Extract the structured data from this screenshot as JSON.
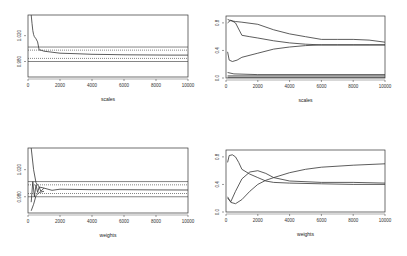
{
  "figure": {
    "layout": "2x2",
    "background": "#ffffff",
    "line_color": "#333333"
  },
  "chart_data": [
    {
      "id": "top-left",
      "type": "line",
      "title": "",
      "xlabel": "scales",
      "ylabel": "",
      "xlim": [
        0,
        10000
      ],
      "ylim": [
        0.97,
        1.03
      ],
      "xticks": [
        0,
        2000,
        4000,
        6000,
        8000,
        10000
      ],
      "xtick_labels": [
        "0",
        "2000",
        "4000",
        "6000",
        "8000",
        "10000"
      ],
      "yticks": [
        1.01,
        0.985
      ],
      "ytick_labels": [
        "1.020",
        "0.980"
      ],
      "grid": false,
      "hlines": [
        {
          "y": 0.999,
          "style": "solid"
        },
        {
          "y": 0.996,
          "style": "dotted"
        },
        {
          "y": 0.988,
          "style": "dotted"
        },
        {
          "y": 0.985,
          "style": "solid"
        }
      ],
      "series": [
        {
          "name": "estimate",
          "x": [
            200,
            250,
            300,
            350,
            400,
            500,
            600,
            700,
            800,
            1000,
            2000,
            3000,
            4000,
            5000,
            6000,
            7000,
            8000,
            9000,
            10000
          ],
          "y": [
            1.03,
            1.022,
            1.015,
            1.011,
            1.009,
            1.007,
            1.004,
            0.996,
            0.996,
            0.995,
            0.993,
            0.9925,
            0.992,
            0.9918,
            0.9915,
            0.9914,
            0.9913,
            0.9912,
            0.9912
          ]
        }
      ]
    },
    {
      "id": "top-right",
      "type": "line",
      "title": "",
      "xlabel": "scales",
      "ylabel": "",
      "xlim": [
        0,
        10000
      ],
      "ylim": [
        0.0,
        0.9
      ],
      "xticks": [
        0,
        2000,
        4000,
        6000,
        8000,
        10000
      ],
      "xtick_labels": [
        "0",
        "2000",
        "4000",
        "6000",
        "8000",
        "10000"
      ],
      "yticks": [
        0.8,
        0.4,
        0.0
      ],
      "ytick_labels": [
        "0.8",
        "0.4",
        "0.0"
      ],
      "grid": false,
      "series": [
        {
          "name": "s1",
          "x": [
            100,
            300,
            600,
            1000,
            2000,
            3000,
            4000,
            5000,
            6000,
            7000,
            8000,
            9000,
            10000
          ],
          "y": [
            0.85,
            0.83,
            0.82,
            0.81,
            0.78,
            0.7,
            0.64,
            0.6,
            0.56,
            0.56,
            0.56,
            0.55,
            0.52
          ]
        },
        {
          "name": "s2",
          "x": [
            100,
            300,
            600,
            1000,
            1500,
            2000,
            3000,
            4000,
            5000,
            6000,
            7000,
            8000,
            9000,
            10000
          ],
          "y": [
            0.8,
            0.84,
            0.8,
            0.62,
            0.6,
            0.58,
            0.54,
            0.51,
            0.49,
            0.48,
            0.48,
            0.48,
            0.48,
            0.48
          ]
        },
        {
          "name": "s3",
          "x": [
            100,
            200,
            400,
            700,
            1000,
            2000,
            3000,
            4000,
            5000,
            6000,
            7000,
            8000,
            9000,
            10000
          ],
          "y": [
            0.38,
            0.26,
            0.24,
            0.26,
            0.3,
            0.36,
            0.42,
            0.45,
            0.47,
            0.48,
            0.48,
            0.48,
            0.48,
            0.48
          ]
        },
        {
          "name": "s4",
          "x": [
            100,
            500,
            2000,
            10000
          ],
          "y": [
            0.08,
            0.06,
            0.05,
            0.05
          ]
        },
        {
          "name": "s5",
          "x": [
            100,
            10000
          ],
          "y": [
            0.03,
            0.03
          ]
        },
        {
          "name": "s6",
          "x": [
            100,
            10000
          ],
          "y": [
            0.01,
            0.01
          ]
        }
      ]
    },
    {
      "id": "bottom-left",
      "type": "line",
      "title": "",
      "xlabel": "weights",
      "ylabel": "",
      "xlim": [
        0,
        10000
      ],
      "ylim": [
        0.97,
        1.03
      ],
      "xticks": [
        0,
        2000,
        4000,
        6000,
        8000,
        10000
      ],
      "xtick_labels": [
        "0",
        "2000",
        "4000",
        "6000",
        "8000",
        "10000"
      ],
      "yticks": [
        1.01,
        0.985
      ],
      "ytick_labels": [
        "1.020",
        "0.980"
      ],
      "grid": false,
      "hlines": [
        {
          "y": 0.999,
          "style": "solid"
        },
        {
          "y": 0.996,
          "style": "dotted"
        },
        {
          "y": 0.988,
          "style": "dotted"
        },
        {
          "y": 0.985,
          "style": "solid"
        }
      ],
      "series": [
        {
          "name": "estimate",
          "x": [
            200,
            300,
            400,
            500,
            600,
            700,
            800,
            1000,
            1500,
            2000,
            4000,
            6000,
            8000,
            10000
          ],
          "y": [
            0.98,
            0.999,
            0.985,
            0.996,
            0.989,
            0.994,
            0.99,
            0.993,
            0.991,
            0.992,
            0.9915,
            0.9915,
            0.9913,
            0.9912
          ]
        },
        {
          "name": "upper-bound",
          "x": [
            200,
            350,
            500,
            700,
            1000
          ],
          "y": [
            1.03,
            1.01,
            0.998,
            0.994,
            0.993
          ]
        },
        {
          "name": "lower-bound",
          "x": [
            200,
            350,
            500,
            700,
            1000
          ],
          "y": [
            0.972,
            0.978,
            0.986,
            0.989,
            0.99
          ]
        }
      ]
    },
    {
      "id": "bottom-right",
      "type": "line",
      "title": "",
      "xlabel": "weights",
      "ylabel": "",
      "xlim": [
        0,
        10000
      ],
      "ylim": [
        0.0,
        0.9
      ],
      "xticks": [
        0,
        2000,
        4000,
        6000,
        8000,
        10000
      ],
      "xtick_labels": [
        "0",
        "2000",
        "4000",
        "6000",
        "8000",
        "10000"
      ],
      "yticks": [
        0.8,
        0.4,
        0.0
      ],
      "ytick_labels": [
        "0.8",
        "0.4",
        "0.0"
      ],
      "grid": false,
      "series": [
        {
          "name": "s1",
          "x": [
            100,
            200,
            400,
            600,
            800,
            1000,
            1500,
            2000,
            2500,
            3000,
            4000,
            6000,
            8000,
            10000
          ],
          "y": [
            0.72,
            0.82,
            0.83,
            0.8,
            0.72,
            0.62,
            0.55,
            0.5,
            0.45,
            0.43,
            0.42,
            0.41,
            0.4,
            0.4
          ]
        },
        {
          "name": "s2",
          "x": [
            100,
            300,
            600,
            1000,
            1500,
            2000,
            2500,
            3000,
            4000,
            6000,
            8000,
            10000
          ],
          "y": [
            0.2,
            0.15,
            0.3,
            0.48,
            0.58,
            0.6,
            0.56,
            0.5,
            0.45,
            0.43,
            0.43,
            0.42
          ]
        },
        {
          "name": "s3",
          "x": [
            100,
            300,
            600,
            1000,
            1500,
            2000,
            2500,
            3000,
            4000,
            5000,
            6000,
            8000,
            10000
          ],
          "y": [
            0.22,
            0.14,
            0.12,
            0.18,
            0.3,
            0.4,
            0.46,
            0.5,
            0.57,
            0.62,
            0.65,
            0.68,
            0.7
          ]
        }
      ]
    }
  ]
}
